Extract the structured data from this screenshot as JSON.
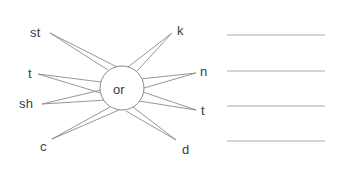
{
  "worksheet": {
    "type": "word-web",
    "center": {
      "text": "or",
      "cx": 122,
      "cy": 88,
      "rx": 22,
      "ry": 22,
      "label_x": 113,
      "label_y": 83
    },
    "stroke_color": "#8a8a8a",
    "text_color": "#3c3c3c",
    "background_color": "#ffffff",
    "spokes": [
      {
        "id": "spoke-st",
        "text": "st",
        "side": "left",
        "label_x": 30,
        "label_y": 26,
        "tip_x": 50,
        "tip_y": 33,
        "attach1_x": 108,
        "attach1_y": 70,
        "attach2_x": 117,
        "attach2_y": 67
      },
      {
        "id": "spoke-t-left",
        "text": "t",
        "side": "left",
        "label_x": 28,
        "label_y": 67,
        "tip_x": 38,
        "tip_y": 74,
        "attach1_x": 101,
        "attach1_y": 82,
        "attach2_x": 104,
        "attach2_y": 94
      },
      {
        "id": "spoke-sh",
        "text": "sh",
        "side": "left",
        "label_x": 19,
        "label_y": 97,
        "tip_x": 42,
        "tip_y": 104,
        "attach1_x": 101,
        "attach1_y": 90,
        "attach2_x": 107,
        "attach2_y": 100
      },
      {
        "id": "spoke-c",
        "text": "c",
        "side": "left",
        "label_x": 40,
        "label_y": 140,
        "tip_x": 52,
        "tip_y": 139,
        "attach1_x": 110,
        "attach1_y": 107,
        "attach2_x": 119,
        "attach2_y": 110
      },
      {
        "id": "spoke-k",
        "text": "k",
        "side": "right",
        "text_anchor": "start",
        "label_x": 177,
        "label_y": 24,
        "tip_x": 172,
        "tip_y": 33,
        "attach1_x": 128,
        "attach1_y": 67,
        "attach2_x": 137,
        "attach2_y": 71
      },
      {
        "id": "spoke-n",
        "text": "n",
        "side": "right",
        "text_anchor": "start",
        "label_x": 200,
        "label_y": 65,
        "tip_x": 196,
        "tip_y": 73,
        "attach1_x": 140,
        "attach1_y": 79,
        "attach2_x": 144,
        "attach2_y": 88
      },
      {
        "id": "spoke-t-right",
        "text": "t",
        "side": "right",
        "text_anchor": "start",
        "label_x": 201,
        "label_y": 104,
        "tip_x": 196,
        "tip_y": 110,
        "attach1_x": 143,
        "attach1_y": 92,
        "attach2_x": 139,
        "attach2_y": 101
      },
      {
        "id": "spoke-d",
        "text": "d",
        "side": "right",
        "text_anchor": "start",
        "label_x": 182,
        "label_y": 143,
        "tip_x": 176,
        "tip_y": 140,
        "attach1_x": 133,
        "attach1_y": 107,
        "attach2_x": 126,
        "attach2_y": 111
      }
    ],
    "writing_lines": {
      "count": 4,
      "x_start": 227,
      "x_end": 325,
      "color": "#a8a8a8",
      "y_positions": [
        35,
        71,
        106,
        141
      ]
    }
  }
}
